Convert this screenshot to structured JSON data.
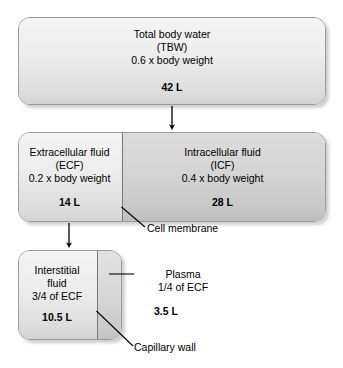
{
  "diagram": {
    "colors": {
      "outline": "#9a9a9a",
      "divider": "#777777",
      "fill_light": "#ededed",
      "fill_dark": "#d6d6d6",
      "text": "#000000"
    },
    "boxes": [
      {
        "id": "tbw",
        "name": "Total body water",
        "lines": [
          "Total body water",
          "(TBW)",
          "0.6 x body weight"
        ],
        "volume": "42 L"
      },
      {
        "id": "ecf",
        "name": "Extracellular fluid",
        "lines": [
          "Extracellular fluid",
          "(ECF)",
          "0.2 x body weight"
        ],
        "volume": "14 L"
      },
      {
        "id": "icf",
        "name": "Intracellular fluid",
        "lines": [
          "Intracellular fluid",
          "(ICF)",
          "0.4 x body weight"
        ],
        "volume": "28 L"
      },
      {
        "id": "interstitial",
        "name": "Interstitial fluid",
        "lines": [
          "Interstitial",
          "fluid",
          "3/4 of ECF"
        ],
        "volume": "10.5 L"
      },
      {
        "id": "plasma",
        "name": "Plasma",
        "lines": [
          "Plasma",
          "1/4 of ECF"
        ],
        "volume": "3.5 L"
      }
    ],
    "text": {
      "tbw_line1": "Total body water",
      "tbw_line2": "(TBW)",
      "tbw_line3": "0.6 x body weight",
      "tbw_volume": "42 L",
      "ecf_line1": "Extracellular fluid",
      "ecf_line2": "(ECF)",
      "ecf_line3": "0.2 x body weight",
      "ecf_volume": "14 L",
      "icf_line1": "Intracellular fluid",
      "icf_line2": "(ICF)",
      "icf_line3": "0.4 x body weight",
      "icf_volume": "28 L",
      "interstitial_line1": "Interstitial",
      "interstitial_line2": "fluid",
      "interstitial_line3": "3/4 of ECF",
      "interstitial_volume": "10.5 L",
      "plasma_line1": "Plasma",
      "plasma_line2": "1/4 of ECF",
      "plasma_volume": "3.5 L",
      "cell_membrane_label": "Cell membrane",
      "capillary_wall_label": "Capillary wall"
    },
    "annotations": [
      {
        "id": "cell-membrane",
        "label": "Cell membrane"
      },
      {
        "id": "capillary-wall",
        "label": "Capillary wall"
      },
      {
        "id": "plasma",
        "label": "Plasma"
      }
    ],
    "arrows": [
      {
        "id": "tbw-to-ecf",
        "from": "Total body water",
        "to": "Extracellular fluid / Intracellular fluid"
      },
      {
        "id": "ecf-to-interstitial",
        "from": "Extracellular fluid",
        "to": "Interstitial fluid / Plasma"
      }
    ]
  }
}
